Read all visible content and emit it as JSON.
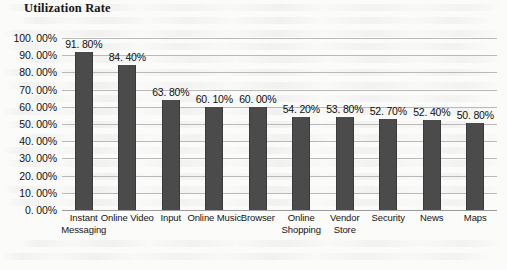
{
  "chart_data": {
    "type": "bar",
    "title": "Utilization Rate",
    "xlabel": "",
    "ylabel": "",
    "ylim": [
      0,
      100
    ],
    "ytick_step": 10,
    "grid": true,
    "legend": false,
    "value_suffix": "%",
    "categories": [
      "Instant Messaging",
      "Online Video",
      "Input",
      "Online Music",
      "Browser",
      "Online Shopping",
      "Vendor Store",
      "Security",
      "News",
      "Maps"
    ],
    "values": [
      91.8,
      84.4,
      63.8,
      60.1,
      60.0,
      54.2,
      53.8,
      52.7,
      52.4,
      50.8
    ],
    "data_labels": [
      "91. 80%",
      "84. 40%",
      "63. 80%",
      "60. 10%",
      "60. 00%",
      "54. 20%",
      "53. 80%",
      "52. 70%",
      "52. 40%",
      "50. 80%"
    ],
    "ytick_labels": [
      "100. 00%",
      "90. 00%",
      "80. 00%",
      "70. 00%",
      "60. 00%",
      "50. 00%",
      "40. 00%",
      "30. 00%",
      "20. 00%",
      "10. 00%",
      "0. 00%"
    ],
    "ytick_values": [
      100,
      90,
      80,
      70,
      60,
      50,
      40,
      30,
      20,
      10,
      0
    ],
    "series_color": "#4b4b4b",
    "gridline_color": "#b9b9b9",
    "background_color": "#fbfbf9"
  }
}
